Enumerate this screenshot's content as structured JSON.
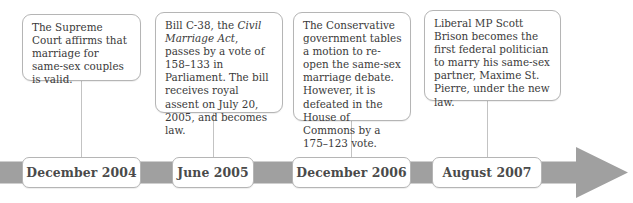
{
  "figure": {
    "kind": "horizontal-timeline",
    "background_color": "#ffffff",
    "arrow_color": "#a0a0a0",
    "box_border_color": "#b5b5b5",
    "text_color": "#3a3a3a",
    "connector_color": "#c3c3c3"
  },
  "events": [
    {
      "id": "dec-2004",
      "date_label": "December 2004",
      "text_parts": [
        {
          "style": "normal",
          "text": "The Supreme Court affirms that marriage for same-sex couples is valid."
        }
      ]
    },
    {
      "id": "jun-2005",
      "date_label": "June 2005",
      "text_parts": [
        {
          "style": "normal",
          "text": "Bill C-38, the "
        },
        {
          "style": "italic",
          "text": "Civil Marriage Act"
        },
        {
          "style": "normal",
          "text": ", passes by a vote of 158–133 in Parliament. The bill receives royal assent on July 20, 2005, and becomes law."
        }
      ]
    },
    {
      "id": "dec-2006",
      "date_label": "December 2006",
      "text_parts": [
        {
          "style": "normal",
          "text": "The Conservative government tables a motion to re-open the same-sex marriage debate. However, it is defeated in the House of Commons by a 175–123 vote."
        }
      ]
    },
    {
      "id": "aug-2007",
      "date_label": "August 2007",
      "text_parts": [
        {
          "style": "normal",
          "text": "Liberal MP Scott Brison becomes the first federal politician to marry his same-sex partner, Maxime St. Pierre, under the new law."
        }
      ]
    }
  ]
}
